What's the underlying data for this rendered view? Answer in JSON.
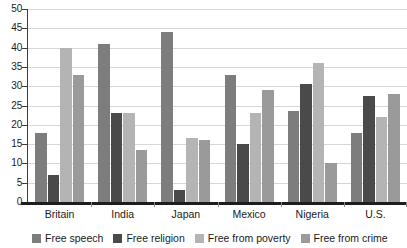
{
  "chart_data": {
    "type": "bar",
    "title": "",
    "subtitle": "",
    "xlabel": "",
    "ylabel": "",
    "ylim": [
      0,
      50
    ],
    "y_ticks": [
      0,
      5,
      10,
      15,
      20,
      25,
      30,
      35,
      40,
      45,
      50
    ],
    "grid": true,
    "legend_position": "bottom",
    "orientation": "vertical",
    "grouping": "grouped",
    "categories": [
      "Britain",
      "India",
      "Japan",
      "Mexico",
      "Nigeria",
      "U.S."
    ],
    "series": [
      {
        "name": "Free speech",
        "color": "#7d7d7d",
        "values": [
          18,
          41,
          44,
          33,
          23.5,
          18
        ]
      },
      {
        "name": "Free religion",
        "color": "#4a4a4a",
        "values": [
          7,
          23,
          3,
          15,
          30.5,
          27.5
        ]
      },
      {
        "name": "Free from poverty",
        "color": "#b4b4b4",
        "values": [
          40,
          23,
          16.5,
          23,
          36,
          22
        ]
      },
      {
        "name": "Free from crime",
        "color": "#9a9a9a",
        "values": [
          33,
          13.5,
          16,
          29,
          10,
          28
        ]
      }
    ],
    "axis_color": "#3c3c3c",
    "baseline_color": "#1d1d1d",
    "gridline_color": "#d7d7d7",
    "background": "#ffffff"
  },
  "legend": {
    "items": [
      {
        "label": "Free speech",
        "color": "#7d7d7d",
        "swatch_name": "legend-swatch-free-speech"
      },
      {
        "label": "Free religion",
        "color": "#4a4a4a",
        "swatch_name": "legend-swatch-free-religion"
      },
      {
        "label": "Free from poverty",
        "color": "#b4b4b4",
        "swatch_name": "legend-swatch-free-from-poverty"
      },
      {
        "label": "Free from crime",
        "color": "#9a9a9a",
        "swatch_name": "legend-swatch-free-from-crime"
      }
    ]
  }
}
